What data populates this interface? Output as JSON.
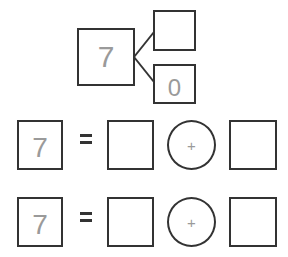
{
  "number_bond": {
    "whole": "7",
    "part_top": "",
    "part_bottom": "0"
  },
  "equations": [
    {
      "total": "7",
      "equals": "=",
      "addend1": "",
      "operator": "+",
      "addend2": ""
    },
    {
      "total": "7",
      "equals": "=",
      "addend1": "",
      "operator": "+",
      "addend2": ""
    }
  ],
  "colors": {
    "stroke": "#333333",
    "digits": "#9a9a9a"
  }
}
